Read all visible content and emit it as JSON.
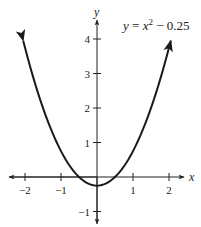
{
  "chart_data": {
    "type": "line",
    "equation": {
      "y": "y",
      "eq": " = ",
      "x": "x",
      "exp": "2",
      "rest": " − 0.25"
    },
    "xlabel": "x",
    "ylabel": "y",
    "xlim": [
      -2.1,
      2.1
    ],
    "ylim": [
      -1.2,
      4.2
    ],
    "x_ticks": [
      -2,
      -1,
      1,
      2
    ],
    "x_tick_labels": [
      "−2",
      "−1",
      "1",
      "2"
    ],
    "y_ticks": [
      -1,
      1,
      2,
      3,
      4
    ],
    "y_tick_labels": [
      "−1",
      "1",
      "2",
      "3",
      "4"
    ],
    "grid": false,
    "series": [
      {
        "name": "y = x^2 - 0.25",
        "function": "x^2 - 0.25",
        "x": [
          -2.05,
          -1.5,
          -1,
          -0.5,
          0,
          0.5,
          1,
          1.5,
          2.05
        ],
        "values": [
          3.95,
          2.0,
          0.75,
          0.0,
          -0.25,
          0.0,
          0.75,
          2.0,
          3.95
        ]
      }
    ],
    "color": "#1a1a1a"
  }
}
